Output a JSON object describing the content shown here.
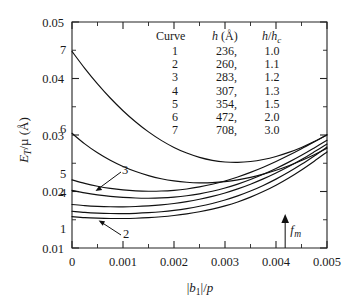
{
  "chart_data": {
    "type": "line",
    "title": "",
    "xlabel": "|b1|/p",
    "ylabel": "E_T/μ (Å)",
    "xlim": [
      0,
      0.005
    ],
    "ylim": [
      0.01,
      0.05
    ],
    "grid": false,
    "legend_position": "inside-top-center",
    "x_ticks": [
      "0",
      "0.001",
      "0.002",
      "0.003",
      "0.004",
      "0.005"
    ],
    "x_tick_values": [
      0,
      0.001,
      0.002,
      0.003,
      0.004,
      0.005
    ],
    "y_ticks": [
      "0.01",
      "0.02",
      "0.03",
      "0.04",
      "0.05"
    ],
    "y_tick_values": [
      0.01,
      0.02,
      0.03,
      0.04,
      0.05
    ],
    "x_minor_step": 0.0005,
    "y_minor_step": 0.005,
    "x": [
      0,
      0.00025,
      0.0005,
      0.00075,
      0.001,
      0.00125,
      0.0015,
      0.00175,
      0.002,
      0.00225,
      0.0025,
      0.00275,
      0.003,
      0.00325,
      0.0035,
      0.00375,
      0.004,
      0.00425,
      0.0045,
      0.00475,
      0.005
    ],
    "series": [
      {
        "name": "1",
        "label": "1",
        "h_angstrom": "236,",
        "h_over_hc": "1.0",
        "values": [
          0.01555,
          0.01538,
          0.01528,
          0.01522,
          0.01522,
          0.01527,
          0.01537,
          0.01553,
          0.01575,
          0.01604,
          0.01641,
          0.01687,
          0.01745,
          0.01815,
          0.019,
          0.01999,
          0.02112,
          0.0224,
          0.02382,
          0.02537,
          0.027
        ]
      },
      {
        "name": "2",
        "label": "2",
        "h_angstrom": "260,",
        "h_over_hc": "1.1",
        "values": [
          0.0165,
          0.0163,
          0.01617,
          0.0161,
          0.01609,
          0.01614,
          0.01625,
          0.01642,
          0.01666,
          0.01698,
          0.01738,
          0.01788,
          0.01849,
          0.01922,
          0.02008,
          0.02107,
          0.02219,
          0.02344,
          0.02481,
          0.0263,
          0.02786
        ]
      },
      {
        "name": "3",
        "label": "3",
        "h_angstrom": "283,",
        "h_over_hc": "1.2",
        "values": [
          0.0177,
          0.0175,
          0.01737,
          0.0173,
          0.01729,
          0.01734,
          0.01745,
          0.01763,
          0.01788,
          0.01821,
          0.01862,
          0.01913,
          0.01974,
          0.02046,
          0.02129,
          0.02223,
          0.02328,
          0.02443,
          0.02568,
          0.02702,
          0.0284
        ]
      },
      {
        "name": "4",
        "label": "4",
        "h_angstrom": "307,",
        "h_over_hc": "1.3",
        "values": [
          0.0202,
          0.01975,
          0.0194,
          0.01913,
          0.01895,
          0.01884,
          0.01881,
          0.01886,
          0.019,
          0.01924,
          0.01959,
          0.02005,
          0.02062,
          0.02131,
          0.02212,
          0.02304,
          0.02407,
          0.0252,
          0.02642,
          0.02772,
          0.02905
        ]
      },
      {
        "name": "5",
        "label": "5",
        "h_angstrom": "354,",
        "h_over_hc": "1.5",
        "values": [
          0.02205,
          0.02143,
          0.02094,
          0.02056,
          0.02029,
          0.02012,
          0.02005,
          0.02008,
          0.02021,
          0.02045,
          0.02081,
          0.02128,
          0.02187,
          0.02257,
          0.02338,
          0.02429,
          0.0253,
          0.0264,
          0.02757,
          0.0288,
          0.03005
        ]
      },
      {
        "name": "6",
        "label": "6",
        "h_angstrom": "472,",
        "h_over_hc": "2.0",
        "values": [
          0.0303,
          0.02843,
          0.02685,
          0.02553,
          0.02443,
          0.02353,
          0.02281,
          0.02226,
          0.02187,
          0.02163,
          0.02153,
          0.02157,
          0.02175,
          0.02206,
          0.0225,
          0.02307,
          0.02376,
          0.02457,
          0.02549,
          0.02652,
          0.02764
        ]
      },
      {
        "name": "7",
        "label": "7",
        "h_angstrom": "708,",
        "h_over_hc": "3.0",
        "values": [
          0.0448,
          0.0418,
          0.03905,
          0.03655,
          0.0343,
          0.0323,
          0.03055,
          0.02905,
          0.0278,
          0.0268,
          0.02604,
          0.02552,
          0.02523,
          0.02516,
          0.02531,
          0.02566,
          0.0262,
          0.02692,
          0.0278,
          0.02883,
          0.03
        ]
      }
    ],
    "annotations": [
      {
        "name": "fm-marker",
        "label": "fm",
        "x": 0.00418,
        "type": "up-arrow",
        "description": "vertical up arrow on x axis at |b1|/p = 0.0042"
      }
    ],
    "legend": {
      "headers": [
        "Curve",
        "h (Å)",
        "h/hc"
      ],
      "header_curve": "Curve",
      "header_h": "h",
      "header_h_units": "(Å)",
      "header_ratio_num": "h",
      "header_ratio_den": "hc"
    },
    "inline_labels": [
      {
        "label": "1",
        "leader": false
      },
      {
        "label": "2",
        "leader": true
      },
      {
        "label": "3",
        "leader": true
      },
      {
        "label": "4",
        "leader": false
      },
      {
        "label": "5",
        "leader": false
      },
      {
        "label": "6",
        "leader": false
      },
      {
        "label": "7",
        "leader": false
      }
    ]
  },
  "axis": {
    "y_label_main": "E",
    "y_label_sub": "T",
    "y_label_rest": "/μ (Å)",
    "x_label_b": "b",
    "x_label_sub": "1",
    "x_label_rest": "/p"
  },
  "colors": {
    "curve": "#111111",
    "axis": "#222222",
    "text": "#1a1a1a",
    "background": "#ffffff"
  }
}
